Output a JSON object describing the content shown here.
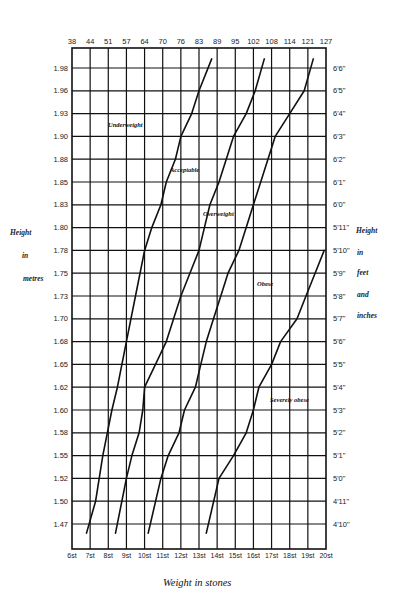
{
  "chart_data": {
    "type": "line",
    "title": "",
    "xlabel": "Weight in stones",
    "ylabel": "Height in metres",
    "y2label": "Height in feet and inches",
    "x_top_label_unit": "kg",
    "x_top_ticks": [
      "38",
      "44",
      "51",
      "57",
      "64",
      "70",
      "76",
      "83",
      "89",
      "95",
      "102",
      "108",
      "114",
      "121",
      "127"
    ],
    "x_bottom_ticks": [
      "6st",
      "7st",
      "8st",
      "9st",
      "10st",
      "11st",
      "12st",
      "13st",
      "14st",
      "15st",
      "16st",
      "17st",
      "18st",
      "19st",
      "20st"
    ],
    "y_left_ticks": [
      "1.98",
      "1.96",
      "1.93",
      "1.90",
      "1.88",
      "1.85",
      "1.83",
      "1.80",
      "1.78",
      "1.75",
      "1.73",
      "1.70",
      "1.68",
      "1.65",
      "1.62",
      "1.60",
      "1.58",
      "1.55",
      "1.52",
      "1.50",
      "1.47"
    ],
    "y_right_ticks": [
      "6'6\"",
      "6'5\"",
      "6'4\"",
      "6'3\"",
      "6'2\"",
      "6'1\"",
      "6'0\"",
      "5'11\"",
      "5'10\"",
      "5'9\"",
      "5'8\"",
      "5'7\"",
      "5'6\"",
      "5'5\"",
      "5'4\"",
      "5'3\"",
      "5'2\"",
      "5'1\"",
      "5'0\"",
      "4'11\"",
      "4'10\""
    ],
    "xlim_stones": [
      6,
      20
    ],
    "ylim_metres": [
      1.46,
      2.0
    ],
    "grid": true,
    "regions": [
      "Underweight",
      "Acceptable",
      "Overweight",
      "Obese",
      "Severely obese"
    ],
    "series": [
      {
        "name": "Underweight / Acceptable boundary",
        "points_stones_metres": [
          [
            6.8,
            1.46
          ],
          [
            7.3,
            1.5
          ],
          [
            7.7,
            1.55
          ],
          [
            8.2,
            1.6
          ],
          [
            8.5,
            1.62
          ],
          [
            9.0,
            1.68
          ],
          [
            9.5,
            1.73
          ],
          [
            10.0,
            1.78
          ],
          [
            10.4,
            1.8
          ],
          [
            10.9,
            1.83
          ],
          [
            11.2,
            1.85
          ],
          [
            11.7,
            1.88
          ],
          [
            12.0,
            1.9
          ],
          [
            12.6,
            1.93
          ],
          [
            13.0,
            1.96
          ],
          [
            13.7,
            1.99
          ]
        ]
      },
      {
        "name": "Acceptable / Overweight boundary",
        "points_stones_metres": [
          [
            8.4,
            1.46
          ],
          [
            9.0,
            1.52
          ],
          [
            9.3,
            1.55
          ],
          [
            9.7,
            1.58
          ],
          [
            9.9,
            1.6
          ],
          [
            10.0,
            1.62
          ],
          [
            10.6,
            1.65
          ],
          [
            11.2,
            1.68
          ],
          [
            11.6,
            1.7
          ],
          [
            12.0,
            1.73
          ],
          [
            12.5,
            1.75
          ],
          [
            13.0,
            1.78
          ],
          [
            13.3,
            1.8
          ],
          [
            13.6,
            1.83
          ],
          [
            14.1,
            1.85
          ],
          [
            14.9,
            1.9
          ],
          [
            15.6,
            1.93
          ],
          [
            16.1,
            1.96
          ],
          [
            16.6,
            1.99
          ]
        ]
      },
      {
        "name": "Overweight / Obese boundary",
        "points_stones_metres": [
          [
            10.2,
            1.46
          ],
          [
            10.9,
            1.52
          ],
          [
            11.3,
            1.55
          ],
          [
            11.9,
            1.58
          ],
          [
            12.2,
            1.6
          ],
          [
            12.8,
            1.62
          ],
          [
            13.1,
            1.65
          ],
          [
            13.4,
            1.68
          ],
          [
            13.8,
            1.7
          ],
          [
            14.2,
            1.73
          ],
          [
            14.6,
            1.75
          ],
          [
            15.2,
            1.78
          ],
          [
            15.6,
            1.8
          ],
          [
            16.0,
            1.83
          ],
          [
            16.4,
            1.85
          ],
          [
            17.2,
            1.9
          ],
          [
            18.0,
            1.93
          ],
          [
            18.8,
            1.96
          ],
          [
            19.3,
            1.99
          ]
        ]
      },
      {
        "name": "Obese / Severely obese boundary",
        "points_stones_metres": [
          [
            13.4,
            1.46
          ],
          [
            14.1,
            1.52
          ],
          [
            14.9,
            1.55
          ],
          [
            15.6,
            1.58
          ],
          [
            16.0,
            1.6
          ],
          [
            16.3,
            1.62
          ],
          [
            17.0,
            1.65
          ],
          [
            17.5,
            1.68
          ],
          [
            18.4,
            1.7
          ],
          [
            18.9,
            1.73
          ],
          [
            19.4,
            1.75
          ],
          [
            19.9,
            1.78
          ]
        ]
      }
    ]
  },
  "labels": {
    "left_axis_title_line1": "Height",
    "left_axis_title_line2": "in",
    "left_axis_title_line3": "metres",
    "right_axis_title_line1": "Height",
    "right_axis_title_line2": "in",
    "right_axis_title_line3": "feet",
    "right_axis_title_line4": "and",
    "right_axis_title_line5": "inches",
    "x_axis_title": "Weight in stones",
    "region_underweight": "Underweight",
    "region_acceptable": "Acceptable",
    "region_overweight": "Overweight",
    "region_obese": "Obese",
    "region_severely_obese": "Severely obese"
  }
}
